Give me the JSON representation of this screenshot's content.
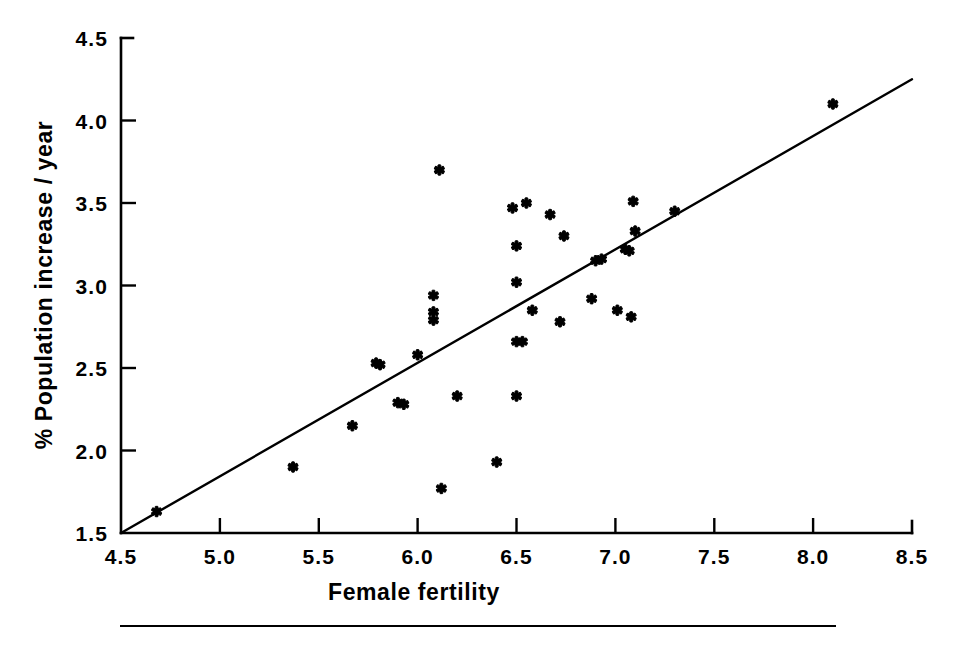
{
  "figure": {
    "background_color": "#ffffff",
    "ink_color": "#000000",
    "has_bottom_rule": true
  },
  "chart_data": {
    "type": "scatter",
    "title": "",
    "subtitle": "",
    "xlabel": "Female fertility",
    "ylabel": "% Population increase / year",
    "xlim": [
      4.5,
      8.5
    ],
    "ylim": [
      1.5,
      4.5
    ],
    "xticks": [
      4.5,
      5.0,
      5.5,
      6.0,
      6.5,
      7.0,
      7.5,
      8.0,
      8.5
    ],
    "yticks": [
      1.5,
      2.0,
      2.5,
      3.0,
      3.5,
      4.0,
      4.5
    ],
    "xtick_labels": [
      "4.5",
      "5.0",
      "5.5",
      "6.0",
      "6.5",
      "7.0",
      "7.5",
      "8.0",
      "8.5"
    ],
    "ytick_labels": [
      "1.5",
      "2.0",
      "2.5",
      "3.0",
      "3.5",
      "4.0",
      "4.5"
    ],
    "grid": false,
    "legend": null,
    "legend_position": "none",
    "marker_style": "asterisk-cross",
    "marker_color": "#000000",
    "series": [
      {
        "name": "countries",
        "type": "scatter",
        "points": [
          [
            4.68,
            1.63
          ],
          [
            5.37,
            1.9
          ],
          [
            5.67,
            2.15
          ],
          [
            5.79,
            2.53
          ],
          [
            5.81,
            2.52
          ],
          [
            5.9,
            2.29
          ],
          [
            5.93,
            2.28
          ],
          [
            6.0,
            2.58
          ],
          [
            6.08,
            2.94
          ],
          [
            6.08,
            2.84
          ],
          [
            6.08,
            2.79
          ],
          [
            6.11,
            3.7
          ],
          [
            6.12,
            1.77
          ],
          [
            6.2,
            2.33
          ],
          [
            6.4,
            1.93
          ],
          [
            6.48,
            3.47
          ],
          [
            6.5,
            3.24
          ],
          [
            6.5,
            3.02
          ],
          [
            6.5,
            2.66
          ],
          [
            6.5,
            2.33
          ],
          [
            6.53,
            2.66
          ],
          [
            6.55,
            3.5
          ],
          [
            6.58,
            2.85
          ],
          [
            6.67,
            3.43
          ],
          [
            6.72,
            2.78
          ],
          [
            6.74,
            3.3
          ],
          [
            6.88,
            2.92
          ],
          [
            6.9,
            3.15
          ],
          [
            6.93,
            3.16
          ],
          [
            7.01,
            2.85
          ],
          [
            7.05,
            3.22
          ],
          [
            7.07,
            3.21
          ],
          [
            7.08,
            2.81
          ],
          [
            7.09,
            3.51
          ],
          [
            7.1,
            3.33
          ],
          [
            7.3,
            3.45
          ],
          [
            8.1,
            4.1
          ]
        ]
      },
      {
        "name": "regression-line",
        "type": "line",
        "endpoints": [
          [
            4.5,
            1.5
          ],
          [
            8.5,
            4.25
          ]
        ]
      }
    ],
    "n_points": 37
  }
}
